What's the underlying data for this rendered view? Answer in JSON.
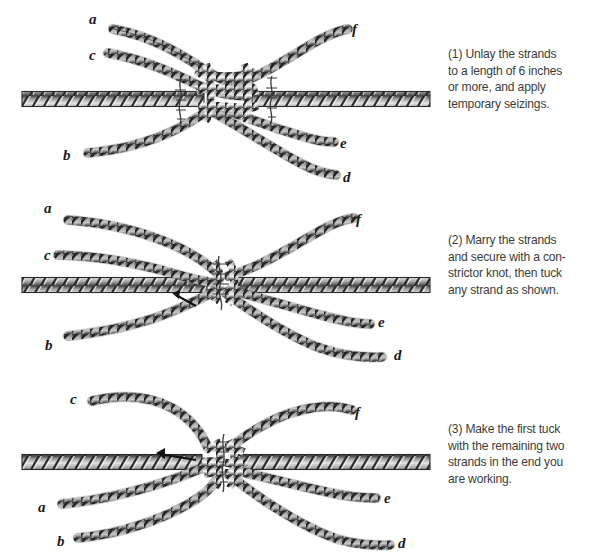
{
  "document": {
    "title": "Long Splice — three-step illustrated sequence",
    "background_color": "#ffffff",
    "ink_color": "#1a1a1a",
    "caption_color": "#3c3c3c"
  },
  "panels": [
    {
      "id": "panel-1",
      "step_number": "(1)",
      "caption": "(1) Unlay the strands to a length of 6 inches or more, and apply temporary seizings.",
      "caption_lines": [
        "(1) Unlay the strands",
        "to a length of 6 inches",
        "or more, and apply",
        "temporary seizings."
      ],
      "labels": [
        {
          "text": "a",
          "x": 89,
          "y": 12
        },
        {
          "text": "c",
          "x": 89,
          "y": 48
        },
        {
          "text": "f",
          "x": 352,
          "y": 22
        },
        {
          "text": "b",
          "x": 63,
          "y": 148
        },
        {
          "text": "e",
          "x": 340,
          "y": 136
        },
        {
          "text": "d",
          "x": 343,
          "y": 170
        }
      ],
      "rope": {
        "y_center": 99,
        "x_start": 22,
        "x_end": 430,
        "thickness": 15
      },
      "seizings": 2
    },
    {
      "id": "panel-2",
      "step_number": "(2)",
      "caption": "(2) Marry the strands and secure with a constrictor knot, then tuck any strand as shown.",
      "caption_lines": [
        "(2) Marry the strands",
        "and secure with a con-",
        "strictor knot, then tuck",
        "any strand as shown."
      ],
      "labels": [
        {
          "text": "a",
          "x": 44,
          "y": 11
        },
        {
          "text": "c",
          "x": 44,
          "y": 58
        },
        {
          "text": "f",
          "x": 356,
          "y": 22
        },
        {
          "text": "b",
          "x": 45,
          "y": 148
        },
        {
          "text": "e",
          "x": 378,
          "y": 125
        },
        {
          "text": "d",
          "x": 394,
          "y": 158
        }
      ],
      "rope": {
        "y_center": 95,
        "x_start": 22,
        "x_end": 430,
        "thickness": 15
      },
      "seizings": 1
    },
    {
      "id": "panel-3",
      "step_number": "(3)",
      "caption": "(3) Make the first tuck with the remaining two strands in the end you are working.",
      "caption_lines": [
        "(3) Make the first tuck",
        "with the remaining two",
        "strands in the end you",
        "are working."
      ],
      "labels": [
        {
          "text": "c",
          "x": 70,
          "y": 16
        },
        {
          "text": "f",
          "x": 355,
          "y": 29
        },
        {
          "text": "a",
          "x": 38,
          "y": 124
        },
        {
          "text": "b",
          "x": 57,
          "y": 158
        },
        {
          "text": "e",
          "x": 384,
          "y": 115
        },
        {
          "text": "d",
          "x": 398,
          "y": 160
        }
      ],
      "rope": {
        "y_center": 86,
        "x_start": 22,
        "x_end": 430,
        "thickness": 15
      },
      "seizings": 1
    }
  ]
}
